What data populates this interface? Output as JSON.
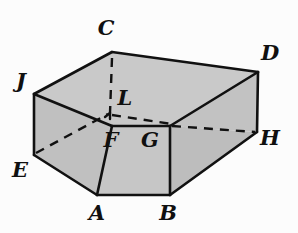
{
  "figure": {
    "kind": "geometric-solid-diagram",
    "background_color": "#fcfcfc",
    "stroke_color": "#111111",
    "stroke_width": 2.6,
    "hidden_stroke_width": 2.4,
    "hidden_dash_pattern": "9,7",
    "face_fill_top": "#c9c9c9",
    "face_fill_front": "#c4c4c4",
    "face_fill_left": "#c0c0c0",
    "face_fill_right": "#bdbdbd",
    "face_fill_inner": "#c9c9c9"
  },
  "vertices": [
    {
      "id": "C",
      "label": "C",
      "x": 112,
      "y": 52,
      "label_x": 106,
      "label_y": 27,
      "hidden": false
    },
    {
      "id": "D",
      "label": "D",
      "x": 258,
      "y": 72,
      "label_x": 270,
      "label_y": 52,
      "hidden": false
    },
    {
      "id": "J",
      "label": "J",
      "x": 34,
      "y": 94,
      "label_x": 21,
      "label_y": 80,
      "hidden": false
    },
    {
      "id": "L",
      "label": "L",
      "x": 110,
      "y": 113,
      "label_x": 125,
      "label_y": 97,
      "hidden": true
    },
    {
      "id": "F",
      "label": "F",
      "x": 112,
      "y": 126,
      "label_x": 111,
      "label_y": 139,
      "hidden": false
    },
    {
      "id": "G",
      "label": "G",
      "x": 170,
      "y": 126,
      "label_x": 150,
      "label_y": 139,
      "hidden": false
    },
    {
      "id": "H",
      "label": "H",
      "x": 257,
      "y": 132,
      "label_x": 270,
      "label_y": 137,
      "hidden": false
    },
    {
      "id": "E",
      "label": "E",
      "x": 34,
      "y": 155,
      "label_x": 20,
      "label_y": 169,
      "hidden": false
    },
    {
      "id": "A",
      "label": "A",
      "x": 97,
      "y": 195,
      "label_x": 97,
      "label_y": 212,
      "hidden": false
    },
    {
      "id": "B",
      "label": "B",
      "x": 170,
      "y": 195,
      "label_x": 168,
      "label_y": 212,
      "hidden": false
    }
  ],
  "faces": [
    {
      "id": "top-face",
      "name": "top-face",
      "points": "112,52 258,72 170,126 112,126 34,94",
      "fill": "#c9c9c9"
    },
    {
      "id": "inner-face",
      "name": "inner-right-face",
      "points": "258,72 257,132 170,126",
      "fill": "#c2c2c2"
    },
    {
      "id": "left-face",
      "name": "left-face",
      "points": "34,94 112,126 112,195 97,195 34,155",
      "fill": "#c0c0c0"
    },
    {
      "id": "front-face",
      "name": "front-face",
      "points": "112,126 170,126 170,195 97,195",
      "fill": "#c6c6c6"
    },
    {
      "id": "right-face",
      "name": "right-face",
      "points": "170,126 257,132 257,132 170,195",
      "fill": "#bdbdbd"
    }
  ],
  "solid_edges": [
    {
      "id": "edge-C-D",
      "name": "edge-C-D",
      "from": "C",
      "to": "D",
      "x1": 112,
      "y1": 52,
      "x2": 258,
      "y2": 72
    },
    {
      "id": "edge-C-J",
      "name": "edge-C-J",
      "from": "C",
      "to": "J",
      "x1": 112,
      "y1": 52,
      "x2": 34,
      "y2": 94
    },
    {
      "id": "edge-J-E",
      "name": "edge-J-E",
      "from": "J",
      "to": "E",
      "x1": 34,
      "y1": 94,
      "x2": 34,
      "y2": 155
    },
    {
      "id": "edge-J-F",
      "name": "edge-J-F",
      "from": "J",
      "to": "F",
      "x1": 34,
      "y1": 94,
      "x2": 112,
      "y2": 126
    },
    {
      "id": "edge-E-A",
      "name": "edge-E-A",
      "from": "E",
      "to": "A",
      "x1": 34,
      "y1": 155,
      "x2": 97,
      "y2": 195
    },
    {
      "id": "edge-A-B",
      "name": "edge-A-B",
      "from": "A",
      "to": "B",
      "x1": 97,
      "y1": 195,
      "x2": 170,
      "y2": 195
    },
    {
      "id": "edge-A-F",
      "name": "edge-A-F",
      "from": "A",
      "to": "F",
      "x1": 97,
      "y1": 195,
      "x2": 112,
      "y2": 126
    },
    {
      "id": "edge-F-G",
      "name": "edge-F-G",
      "from": "F",
      "to": "G",
      "x1": 112,
      "y1": 126,
      "x2": 170,
      "y2": 126
    },
    {
      "id": "edge-B-G",
      "name": "edge-B-G",
      "from": "B",
      "to": "G",
      "x1": 170,
      "y1": 195,
      "x2": 170,
      "y2": 126
    },
    {
      "id": "edge-B-H",
      "name": "edge-B-H",
      "from": "B",
      "to": "H",
      "x1": 170,
      "y1": 195,
      "x2": 257,
      "y2": 132
    },
    {
      "id": "edge-D-H",
      "name": "edge-D-H",
      "from": "D",
      "to": "H",
      "x1": 258,
      "y1": 72,
      "x2": 257,
      "y2": 132
    },
    {
      "id": "edge-D-G",
      "name": "edge-D-G",
      "from": "D",
      "to": "G",
      "x1": 258,
      "y1": 72,
      "x2": 170,
      "y2": 126
    }
  ],
  "hidden_edges": [
    {
      "id": "edge-C-L",
      "name": "hidden-edge-C-L",
      "from": "C",
      "to": "L",
      "x1": 112,
      "y1": 58,
      "x2": 110,
      "y2": 113
    },
    {
      "id": "edge-L-G",
      "name": "hidden-edge-L-G",
      "from": "L",
      "to": "G",
      "x1": 112,
      "y1": 115,
      "x2": 172,
      "y2": 124
    },
    {
      "id": "edge-E-L",
      "name": "hidden-edge-E-L",
      "from": "E",
      "to": "L",
      "x1": 36,
      "y1": 153,
      "x2": 108,
      "y2": 114
    },
    {
      "id": "edge-G-H",
      "name": "hidden-edge-G-H",
      "from": "G",
      "to": "H",
      "x1": 172,
      "y1": 126,
      "x2": 255,
      "y2": 132
    }
  ],
  "vertex_ticks": [
    {
      "id": "tick-L",
      "name": "vertex-tick-L",
      "x": 110,
      "y": 113
    }
  ]
}
